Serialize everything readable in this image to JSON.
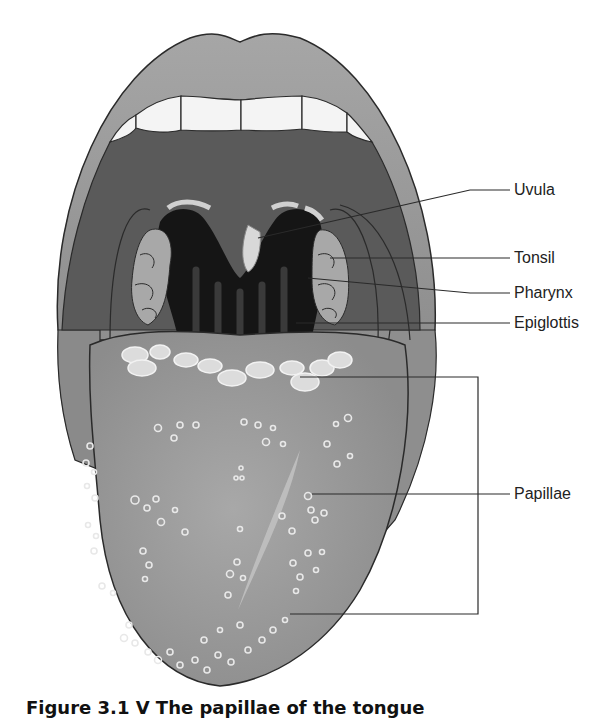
{
  "figure": {
    "caption": "Figure 3.1  V The papillae of the tongue"
  },
  "labels": [
    {
      "id": "uvula",
      "text": "Uvula",
      "x": 514,
      "y": 182
    },
    {
      "id": "tonsil",
      "text": "Tonsil",
      "x": 514,
      "y": 250
    },
    {
      "id": "pharynx",
      "text": "Pharynx",
      "x": 514,
      "y": 285
    },
    {
      "id": "epiglottis",
      "text": "Epiglottis",
      "x": 514,
      "y": 315
    },
    {
      "id": "papillae",
      "text": "Papillae",
      "x": 514,
      "y": 486
    }
  ],
  "colors": {
    "lip": "#9a9a9a",
    "lip_highlight": "#b8b8b8",
    "mouth_cavity": "#5a5a5a",
    "throat": "#1a1a1a",
    "teeth": "#f4f4f4",
    "tonsil": "#a8a8a8",
    "tongue": "#9e9e9e",
    "papilla": "#e2e2e2",
    "outline": "#2a2a2a"
  }
}
